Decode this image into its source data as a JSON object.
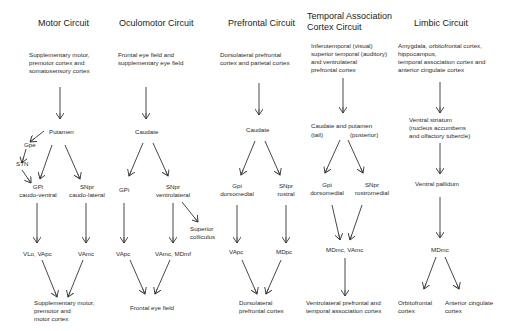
{
  "colors": {
    "background": "#ffffff",
    "text": "#222222",
    "arrow": "#333333"
  },
  "circuits": [
    {
      "title": "Motor Circuit",
      "source": "Supplementary motor,\npremotor cortex and\nsomatosensory cortex",
      "striatum": "Putamen",
      "gpe": "Gpe",
      "stn": "STN",
      "gpi": "GPi\ncaudo-ventral",
      "snpr": "SNpr\ncaudo-lateral",
      "thal_left": "VLo, VApc",
      "thal_right": "VAmc",
      "target": "Supplementary motor,\npremotor and\nmotor cortex"
    },
    {
      "title": "Oculomotor Circuit",
      "source": "Frontal eye field and\nsupplementary eye field",
      "striatum": "Caudate",
      "gpi": "GPi",
      "snpr": "SNpr\nventrolateral",
      "colliculus": "Superior\ncolliculus",
      "thal_left": "VApc",
      "thal_right": "VAmc, MDmf",
      "target": "Frontal eye field"
    },
    {
      "title": "Prefrontal Circuit",
      "source": "Dorsolateral prefrontal\ncortex and parietal cortex",
      "striatum": "Caudate",
      "gpi": "Gpi\ndorsomedial",
      "snpr": "SNpr\nrostral",
      "thal_left": "VApc",
      "thal_right": "MDpc",
      "target": "Dorsolateral\nprefrontal cortex"
    },
    {
      "title": "Temporal Association\nCortex Circuit",
      "source": "Inferotemporal (visual)\nsuperior temporal (auditory)\nand ventrolateral\nprefrontal cortex",
      "striatum": "Caudate and putamen",
      "striatum_left": "(tail)",
      "striatum_right": "(posterior)",
      "gpi": "Gpi\ndorsomedial",
      "snpr": "SNpr\nrostromedial",
      "thalamus": "MDmc, VAmc",
      "target": "Ventrolateral prefrontal and\ntemporal association cortex"
    },
    {
      "title": "Limbic Circuit",
      "source": "Amygdala, orbitofrontal cortex,\nhippocampus,\ntemporal association cortex and\nanterior cingulate cortex",
      "striatum": "Ventral striatum\n(nucleus accumbens\nand olfactory tubercle)",
      "pallidum": "Ventral pallidum",
      "thalamus": "MDmc",
      "target_left": "Orbitofrontal\ncortex",
      "target_right": "Anterior cingulate\ncortex"
    }
  ]
}
